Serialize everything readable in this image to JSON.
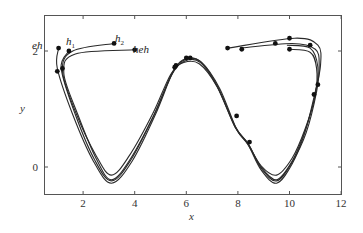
{
  "chart_data": {
    "type": "line",
    "title": "",
    "xlabel": "x",
    "ylabel": "y",
    "xlim": [
      0.5,
      12
    ],
    "ylim": [
      -0.45,
      2.45
    ],
    "xticks": [
      2,
      4,
      6,
      8,
      10,
      12
    ],
    "yticks": [
      0,
      2
    ],
    "grid": false,
    "legend": null,
    "annotations": [
      {
        "text": "eh",
        "x": 1.05,
        "y": 2.2
      },
      {
        "text": "h1",
        "x": 1.5,
        "y": 2.2
      },
      {
        "text": "h2",
        "x": 3.2,
        "y": 2.28
      },
      {
        "text": "heh",
        "x": 4.1,
        "y": 2.0
      }
    ],
    "series": [
      {
        "name": "eh",
        "points": [
          [
            1.05,
            2.05
          ],
          [
            1.0,
            1.7
          ],
          [
            1.6,
            0.9
          ],
          [
            2.4,
            0.1
          ],
          [
            3.1,
            -0.28
          ],
          [
            3.9,
            0.1
          ],
          [
            4.8,
            0.9
          ],
          [
            5.5,
            1.65
          ],
          [
            6.0,
            1.87
          ],
          [
            6.6,
            1.8
          ],
          [
            7.3,
            1.35
          ],
          [
            7.95,
            0.65
          ],
          [
            8.4,
            0.38
          ],
          [
            8.9,
            -0.05
          ],
          [
            9.5,
            -0.28
          ],
          [
            10.1,
            0.05
          ],
          [
            10.6,
            0.6
          ],
          [
            11.0,
            1.3
          ],
          [
            11.2,
            1.75
          ],
          [
            11.1,
            2.1
          ],
          [
            10.2,
            2.22
          ],
          [
            7.6,
            2.05
          ]
        ]
      },
      {
        "name": "h1",
        "points": [
          [
            1.45,
            2.0
          ],
          [
            1.15,
            1.7
          ],
          [
            1.7,
            0.9
          ],
          [
            2.45,
            0.12
          ],
          [
            3.1,
            -0.24
          ],
          [
            3.85,
            0.12
          ],
          [
            4.75,
            0.9
          ],
          [
            5.45,
            1.62
          ],
          [
            5.95,
            1.85
          ],
          [
            6.55,
            1.82
          ],
          [
            7.2,
            1.4
          ],
          [
            7.9,
            0.7
          ],
          [
            8.4,
            0.4
          ],
          [
            8.9,
            -0.02
          ],
          [
            9.5,
            -0.24
          ],
          [
            10.1,
            0.08
          ],
          [
            10.65,
            0.6
          ],
          [
            11.05,
            1.3
          ],
          [
            11.15,
            1.75
          ],
          [
            11.0,
            2.03
          ],
          [
            10.1,
            2.13
          ],
          [
            8.1,
            2.05
          ]
        ]
      },
      {
        "name": "h2",
        "points": [
          [
            3.2,
            2.13
          ],
          [
            1.6,
            2.0
          ],
          [
            1.2,
            1.65
          ],
          [
            1.75,
            0.9
          ],
          [
            2.5,
            0.2
          ],
          [
            3.1,
            -0.14
          ],
          [
            3.8,
            0.2
          ],
          [
            4.7,
            0.92
          ],
          [
            5.4,
            1.6
          ],
          [
            5.9,
            1.8
          ],
          [
            6.5,
            1.78
          ],
          [
            7.2,
            1.38
          ],
          [
            7.9,
            0.68
          ],
          [
            8.35,
            0.42
          ],
          [
            8.9,
            0.02
          ],
          [
            9.5,
            -0.14
          ],
          [
            10.1,
            0.15
          ],
          [
            10.6,
            0.65
          ],
          [
            11.0,
            1.25
          ],
          [
            11.05,
            1.7
          ],
          [
            10.8,
            1.98
          ],
          [
            10.0,
            2.03
          ]
        ]
      },
      {
        "name": "heh",
        "points": [
          [
            4.0,
            2.02
          ],
          [
            1.7,
            1.95
          ],
          [
            1.25,
            1.62
          ],
          [
            1.8,
            0.9
          ],
          [
            2.5,
            0.15
          ],
          [
            3.1,
            -0.22
          ],
          [
            3.85,
            0.15
          ],
          [
            4.75,
            0.9
          ],
          [
            5.45,
            1.6
          ],
          [
            5.95,
            1.83
          ],
          [
            6.55,
            1.8
          ],
          [
            7.2,
            1.38
          ],
          [
            7.9,
            0.68
          ],
          [
            8.4,
            0.4
          ],
          [
            8.9,
            0.0
          ],
          [
            9.5,
            -0.22
          ],
          [
            10.1,
            0.1
          ],
          [
            10.6,
            0.62
          ],
          [
            11.0,
            1.25
          ],
          [
            11.1,
            1.72
          ],
          [
            10.8,
            2.05
          ],
          [
            9.9,
            2.1
          ]
        ]
      }
    ],
    "markers": [
      [
        1.05,
        2.05
      ],
      [
        1.45,
        2.0
      ],
      [
        3.2,
        2.13
      ],
      [
        4.0,
        2.02
      ],
      [
        1.0,
        1.65
      ],
      [
        1.2,
        1.7
      ],
      [
        5.55,
        1.72
      ],
      [
        5.6,
        1.75
      ],
      [
        6.0,
        1.88
      ],
      [
        6.15,
        1.88
      ],
      [
        7.95,
        0.88
      ],
      [
        8.45,
        0.43
      ],
      [
        7.6,
        2.05
      ],
      [
        8.15,
        2.03
      ],
      [
        9.45,
        2.13
      ],
      [
        10.0,
        2.22
      ],
      [
        10.0,
        2.03
      ],
      [
        10.8,
        2.1
      ],
      [
        11.1,
        1.42
      ],
      [
        10.95,
        1.25
      ]
    ]
  },
  "axes": {
    "x_label": "x",
    "y_label": "y",
    "x_tick_labels": [
      "2",
      "4",
      "6",
      "8",
      "10",
      "12"
    ],
    "y_tick_labels": [
      "0",
      "2"
    ]
  },
  "labels": {
    "eh": "eh",
    "h1_base": "h",
    "h1_sub": "1",
    "h2_base": "h",
    "h2_sub": "2",
    "heh": "heh"
  }
}
